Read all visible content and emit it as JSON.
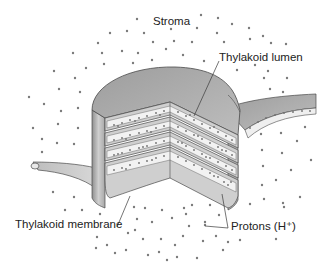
{
  "diagram": {
    "labels": {
      "stroma": "Stroma",
      "lumen": "Thylakoid lumen",
      "membrane": "Thylakoid membrane",
      "protons": "Protons (H⁺)"
    },
    "colors": {
      "background": "#ffffff",
      "membrane_top": "#a9a9a9",
      "membrane_side": "#c4c4c4",
      "lumen_fill": "#f2f2f2",
      "proton_dot": "#6f6f6f",
      "outline": "#4a4a4a",
      "leader_line": "#3a3a3a"
    },
    "stack": {
      "disc_count": 4
    }
  }
}
